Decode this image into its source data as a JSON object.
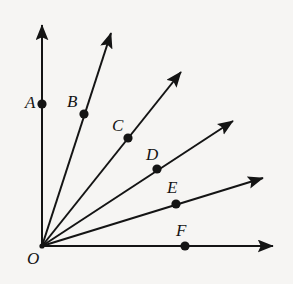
{
  "figure": {
    "type": "geometry-diagram",
    "width": 293,
    "height": 284,
    "background_color": "#f6f5f3",
    "ink_color": "#141414",
    "origin": {
      "label": "O",
      "x": 42,
      "y": 246,
      "label_x": 27,
      "label_y": 250
    },
    "rays": [
      {
        "name": "ray-oa-vertical-axis",
        "from_x": 42,
        "from_y": 246,
        "to_x": 42,
        "to_y": 25,
        "point": {
          "label": "A",
          "x": 42,
          "y": 104,
          "label_x": 25,
          "label_y": 94
        }
      },
      {
        "name": "ray-ob",
        "from_x": 42,
        "from_y": 246,
        "to_x": 111,
        "to_y": 33,
        "point": {
          "label": "B",
          "x": 84,
          "y": 114,
          "label_x": 67,
          "label_y": 93
        }
      },
      {
        "name": "ray-oc",
        "from_x": 42,
        "from_y": 246,
        "to_x": 181,
        "to_y": 72,
        "point": {
          "label": "C",
          "x": 128,
          "y": 138,
          "label_x": 112,
          "label_y": 117
        }
      },
      {
        "name": "ray-od",
        "from_x": 42,
        "from_y": 246,
        "to_x": 233,
        "to_y": 121,
        "point": {
          "label": "D",
          "x": 157,
          "y": 169,
          "label_x": 146,
          "label_y": 146
        }
      },
      {
        "name": "ray-oe",
        "from_x": 42,
        "from_y": 246,
        "to_x": 263,
        "to_y": 178,
        "point": {
          "label": "E",
          "x": 176,
          "y": 204,
          "label_x": 167,
          "label_y": 179
        }
      },
      {
        "name": "ray-of-horizontal-axis",
        "from_x": 42,
        "from_y": 246,
        "to_x": 273,
        "to_y": 246,
        "point": {
          "label": "F",
          "x": 185,
          "y": 246,
          "label_x": 176,
          "label_y": 222
        }
      }
    ]
  }
}
